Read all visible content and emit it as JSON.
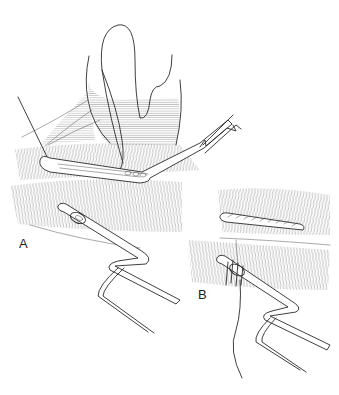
{
  "figure": {
    "type": "surgical line illustration",
    "panels": [
      {
        "id": "A",
        "label": "A"
      },
      {
        "id": "B",
        "label": "B"
      }
    ],
    "colors": {
      "ink": "#2a2a2a",
      "background": "#ffffff"
    }
  }
}
